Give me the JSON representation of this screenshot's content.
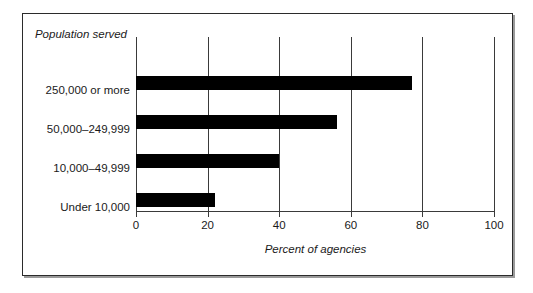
{
  "chart_data": {
    "type": "bar",
    "orientation": "horizontal",
    "title": "",
    "category_axis_title": "Population served",
    "xlabel": "Percent of agencies",
    "ylabel": "",
    "categories": [
      "250,000 or more",
      "50,000–249,999",
      "10,000–49,999",
      "Under 10,000"
    ],
    "values": [
      77,
      56,
      40,
      22
    ],
    "xlim": [
      0,
      100
    ],
    "xticks": [
      0,
      20,
      40,
      60,
      80,
      100
    ],
    "xtick_labels": [
      "0",
      "20",
      "40",
      "60",
      "80",
      "100"
    ],
    "grid": "vertical",
    "legend": "none",
    "bar_color": "#000000",
    "frame_color": "#2b2b2b"
  }
}
